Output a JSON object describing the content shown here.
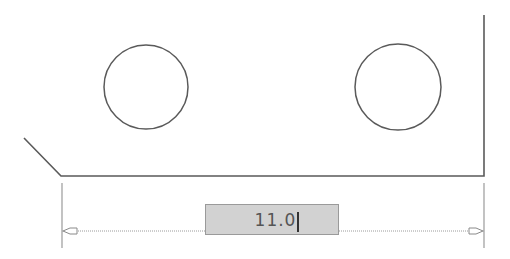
{
  "drawing": {
    "stroke_color": "#5a5a5a",
    "dimension_color": "#9a9a9a",
    "holes": [
      {
        "name": "left-hole",
        "cx": 146,
        "cy": 87,
        "r": 42
      },
      {
        "name": "right-hole",
        "cx": 398,
        "cy": 87,
        "r": 43
      }
    ],
    "outline": {
      "chamfer_start": [
        24,
        138
      ],
      "chamfer_end": [
        61,
        176
      ],
      "bottom_right": [
        484,
        176
      ],
      "top_right": [
        484,
        15
      ]
    },
    "dimension": {
      "left_x": 62,
      "right_x": 484,
      "line_y": 231,
      "ext_top": 183,
      "ext_bottom": 248
    }
  },
  "dimension_input": {
    "value": "11.0",
    "background": "#d2d2d2"
  }
}
